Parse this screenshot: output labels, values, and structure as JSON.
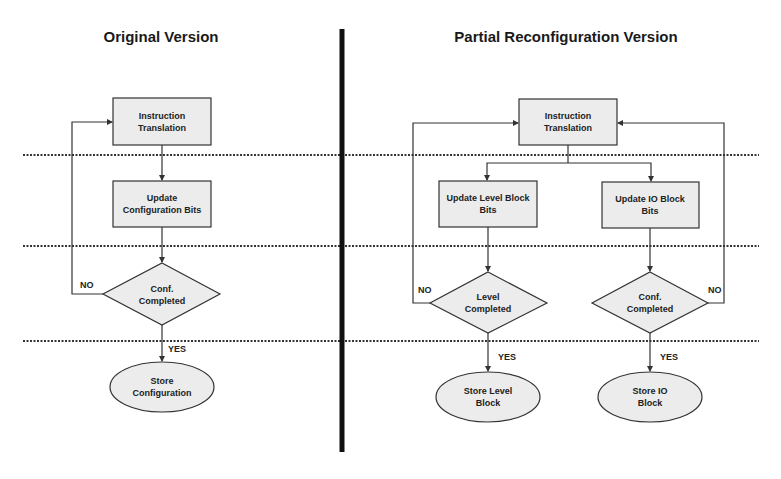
{
  "diagram": {
    "type": "flowchart-comparison",
    "colors": {
      "node_fill": "#ececec",
      "stroke": "#333333",
      "divider": "#111111",
      "text": "#222222"
    },
    "left_panel": {
      "title": "Original Version",
      "nodes": {
        "instruction_translation": {
          "shape": "rectangle",
          "line1": "Instruction",
          "line2": "Translation"
        },
        "update_config_bits": {
          "shape": "rectangle",
          "line1": "Update",
          "line2": "Configuration Bits"
        },
        "conf_completed": {
          "shape": "diamond",
          "line1": "Conf.",
          "line2": "Completed"
        },
        "store_configuration": {
          "shape": "ellipse",
          "line1": "Store",
          "line2": "Configuration"
        }
      },
      "edge_labels": {
        "no": "NO",
        "yes": "YES"
      },
      "edges": [
        {
          "from": "instruction_translation",
          "to": "update_config_bits"
        },
        {
          "from": "update_config_bits",
          "to": "conf_completed"
        },
        {
          "from": "conf_completed",
          "to": "store_configuration",
          "label": "YES"
        },
        {
          "from": "conf_completed",
          "to": "instruction_translation",
          "label": "NO"
        }
      ]
    },
    "right_panel": {
      "title": "Partial Reconfiguration Version",
      "nodes": {
        "instruction_translation": {
          "shape": "rectangle",
          "line1": "Instruction",
          "line2": "Translation"
        },
        "update_level_block_bits": {
          "shape": "rectangle",
          "line1": "Update Level Block",
          "line2": "Bits"
        },
        "update_io_block_bits": {
          "shape": "rectangle",
          "line1": "Update IO Block",
          "line2": "Bits"
        },
        "level_completed": {
          "shape": "diamond",
          "line1": "Level",
          "line2": "Completed"
        },
        "conf_completed": {
          "shape": "diamond",
          "line1": "Conf.",
          "line2": "Completed"
        },
        "store_level_block": {
          "shape": "ellipse",
          "line1": "Store Level",
          "line2": "Block"
        },
        "store_io_block": {
          "shape": "ellipse",
          "line1": "Store IO",
          "line2": "Block"
        }
      },
      "edge_labels": {
        "no_left": "NO",
        "yes_left": "YES",
        "no_right": "NO",
        "yes_right": "YES"
      },
      "edges": [
        {
          "from": "instruction_translation",
          "to": "update_level_block_bits"
        },
        {
          "from": "instruction_translation",
          "to": "update_io_block_bits"
        },
        {
          "from": "update_level_block_bits",
          "to": "level_completed"
        },
        {
          "from": "update_io_block_bits",
          "to": "conf_completed"
        },
        {
          "from": "level_completed",
          "to": "store_level_block",
          "label": "YES"
        },
        {
          "from": "level_completed",
          "to": "instruction_translation",
          "label": "NO"
        },
        {
          "from": "conf_completed",
          "to": "store_io_block",
          "label": "YES"
        },
        {
          "from": "conf_completed",
          "to": "instruction_translation",
          "label": "NO"
        }
      ]
    },
    "separators": {
      "dotted_rows": 3,
      "vertical_divider": true
    }
  }
}
